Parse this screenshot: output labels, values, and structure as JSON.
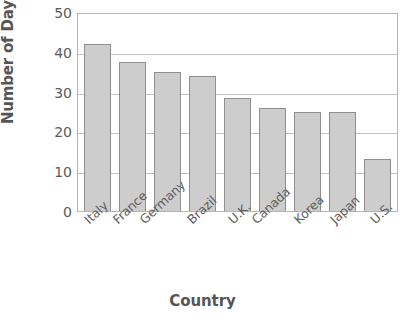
{
  "chart_data": {
    "type": "bar",
    "title": "",
    "xlabel": "Country",
    "ylabel": "Number of Days",
    "categories": [
      "Italy",
      "France",
      "Germany",
      "Brazil",
      "U.K.",
      "Canada",
      "Korea",
      "Japan",
      "U.S."
    ],
    "values": [
      42,
      37.5,
      35,
      34,
      28.5,
      26,
      25,
      25,
      13
    ],
    "ylim": [
      0,
      50
    ],
    "yticks": [
      0,
      10,
      20,
      30,
      40,
      50
    ],
    "ytick_labels": [
      "0",
      "10",
      "20",
      "30",
      "40",
      "50"
    ],
    "grid": true,
    "legend": false,
    "bar_color": "#cdcdcd",
    "bar_border_color": "#8f8f8f",
    "gridline_color": "#c3c3c3",
    "axis_color": "#b4b4b4",
    "text_color": "#555555"
  }
}
